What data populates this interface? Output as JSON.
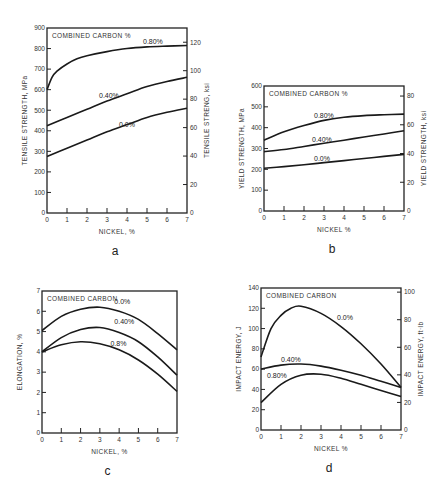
{
  "chart_data": [
    {
      "id": "a",
      "type": "line",
      "caption": "a",
      "title": "COMBINED CARBON %",
      "xlabel": "NICKEL, %",
      "ylabel": "TENSILE STRENGTH, MPa",
      "ylabel_right": "TENSILE STRENG, ksi",
      "xlim": [
        0,
        7
      ],
      "ylim": [
        0,
        900
      ],
      "ylim_right": [
        0,
        130
      ],
      "xticks": [
        0,
        1,
        2,
        3,
        4,
        5,
        6,
        7
      ],
      "yticks": [
        0,
        100,
        200,
        300,
        400,
        500,
        600,
        700,
        800,
        900
      ],
      "yticks_right": [
        0,
        20,
        40,
        60,
        80,
        100,
        120
      ],
      "frame": {
        "left": 47,
        "top": 28,
        "right": 187,
        "bottom": 213
      },
      "series": [
        {
          "name": "0.80%",
          "x": [
            0,
            0.25,
            0.5,
            1,
            1.5,
            2,
            3,
            4,
            5,
            6,
            7
          ],
          "y": [
            600,
            660,
            690,
            725,
            750,
            765,
            785,
            800,
            808,
            812,
            815
          ],
          "label_at": [
            4.8,
            820
          ]
        },
        {
          "name": "0.40%",
          "x": [
            0,
            1,
            2,
            3,
            4,
            5,
            6,
            7
          ],
          "y": [
            425,
            465,
            505,
            545,
            580,
            615,
            640,
            660
          ],
          "label_at": [
            2.6,
            560
          ]
        },
        {
          "name": "0.0%",
          "x": [
            0,
            1,
            2,
            3,
            4,
            5,
            6,
            7
          ],
          "y": [
            275,
            315,
            355,
            395,
            430,
            465,
            490,
            510
          ],
          "label_at": [
            3.6,
            420
          ]
        }
      ]
    },
    {
      "id": "b",
      "type": "line",
      "caption": "b",
      "title": "COMBINED CARBON %",
      "xlabel": "NICKEL %",
      "ylabel": "YIELD STRENGTH, MPa",
      "ylabel_right": "YIELD STRENGTH, ksi",
      "xlim": [
        0,
        7
      ],
      "ylim": [
        0,
        600
      ],
      "ylim_right": [
        0,
        87
      ],
      "xticks": [
        0,
        1,
        2,
        3,
        4,
        5,
        6,
        7
      ],
      "yticks": [
        0,
        100,
        200,
        300,
        400,
        500,
        600
      ],
      "yticks_right": [
        0,
        20,
        40,
        60,
        80
      ],
      "frame": {
        "left": 264,
        "top": 86,
        "right": 404,
        "bottom": 211
      },
      "series": [
        {
          "name": "0.80%",
          "x": [
            0,
            1,
            2,
            3,
            4,
            5,
            6,
            7
          ],
          "y": [
            340,
            380,
            410,
            435,
            450,
            458,
            462,
            465
          ],
          "label_at": [
            2.5,
            445
          ]
        },
        {
          "name": "0.40%",
          "x": [
            0,
            1,
            2,
            3,
            4,
            5,
            6,
            7
          ],
          "y": [
            285,
            295,
            310,
            325,
            340,
            355,
            370,
            385
          ],
          "label_at": [
            2.4,
            330
          ]
        },
        {
          "name": "0.0%",
          "x": [
            0,
            1,
            2,
            3,
            4,
            5,
            6,
            7
          ],
          "y": [
            205,
            213,
            222,
            232,
            242,
            252,
            262,
            272
          ],
          "label_at": [
            2.5,
            240
          ]
        }
      ]
    },
    {
      "id": "c",
      "type": "line",
      "caption": "c",
      "title": "COMBINED CARBON",
      "xlabel": "NICKEL, %",
      "ylabel": "ELONGATION, %",
      "xlim": [
        0,
        7
      ],
      "ylim": [
        0,
        7
      ],
      "xticks": [
        0,
        1,
        2,
        3,
        4,
        5,
        6,
        7
      ],
      "yticks": [
        0,
        1,
        2,
        3,
        4,
        5,
        6,
        7
      ],
      "frame": {
        "left": 42,
        "top": 291,
        "right": 177,
        "bottom": 433
      },
      "series": [
        {
          "name": "0.0%",
          "x": [
            0,
            1,
            2,
            3,
            4,
            5,
            6,
            7
          ],
          "y": [
            5.05,
            5.75,
            6.1,
            6.2,
            6.0,
            5.6,
            4.9,
            4.1
          ],
          "label_at": [
            3.75,
            6.35
          ]
        },
        {
          "name": "0.40%",
          "x": [
            0,
            1,
            2,
            3,
            4,
            5,
            6,
            7
          ],
          "y": [
            4.0,
            4.7,
            5.1,
            5.2,
            4.95,
            4.5,
            3.75,
            2.85
          ],
          "label_at": [
            3.75,
            5.35
          ]
        },
        {
          "name": "0.8%",
          "x": [
            0,
            1,
            2,
            3,
            4,
            5,
            6,
            7
          ],
          "y": [
            4.0,
            4.35,
            4.5,
            4.4,
            4.1,
            3.6,
            2.9,
            2.05
          ],
          "label_at": [
            3.55,
            4.3
          ]
        }
      ]
    },
    {
      "id": "d",
      "type": "line",
      "caption": "d",
      "title": "COMBINED CARBON",
      "xlabel": "NICKEL %",
      "ylabel": "IMPACT ENERGY, J",
      "ylabel_right": "IMPACT ENERGY, ft·lb",
      "xlim": [
        0,
        7
      ],
      "ylim": [
        0,
        140
      ],
      "ylim_right": [
        0,
        103
      ],
      "xticks": [
        0,
        1,
        2,
        3,
        4,
        5,
        6,
        7
      ],
      "yticks": [
        0,
        20,
        40,
        60,
        80,
        100,
        120,
        140
      ],
      "yticks_right": [
        0,
        20,
        40,
        60,
        80,
        100
      ],
      "frame": {
        "left": 261,
        "top": 288,
        "right": 401,
        "bottom": 430
      },
      "series": [
        {
          "name": "0.0%",
          "x": [
            0,
            0.5,
            1,
            1.5,
            2,
            3,
            4,
            5,
            6,
            7
          ],
          "y": [
            72,
            100,
            113,
            120,
            122,
            115,
            102,
            85,
            65,
            42
          ],
          "label_at": [
            3.8,
            108
          ]
        },
        {
          "name": "0.40%",
          "x": [
            0,
            1,
            2,
            3,
            4,
            5,
            6,
            7
          ],
          "y": [
            60,
            64,
            65,
            63,
            59,
            54,
            48,
            42
          ],
          "label_at": [
            1.0,
            67
          ]
        },
        {
          "name": "0.80%",
          "x": [
            0,
            1,
            2,
            3,
            4,
            5,
            6,
            7
          ],
          "y": [
            27,
            45,
            54,
            55,
            51,
            45,
            39,
            33
          ],
          "label_at": [
            0.3,
            51
          ]
        }
      ]
    }
  ]
}
